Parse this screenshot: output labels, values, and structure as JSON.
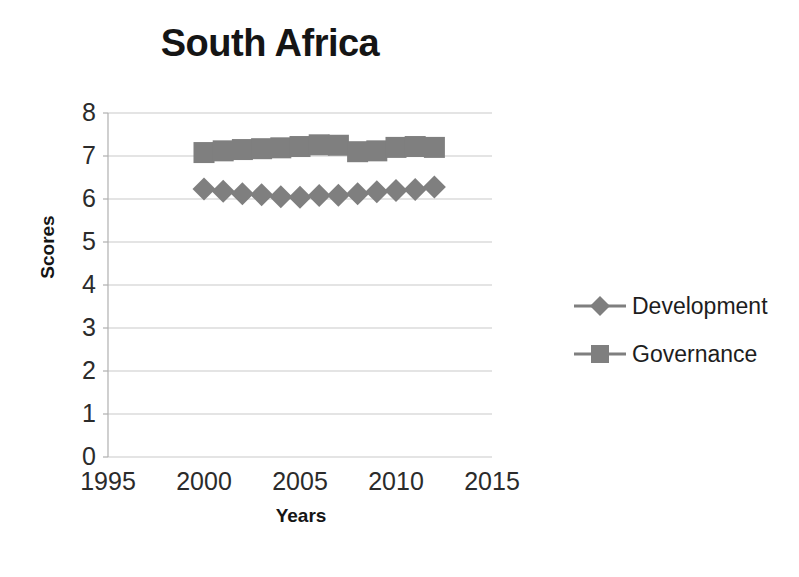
{
  "chart_data": {
    "type": "line",
    "title": "South Africa",
    "xlabel": "Years",
    "ylabel": "Scores",
    "xlim": [
      1995,
      2015
    ],
    "ylim": [
      0,
      8
    ],
    "grid": true,
    "legend_position": "right",
    "x_ticks": [
      "1995",
      "2000",
      "2005",
      "2010",
      "2015"
    ],
    "x_tick_values": [
      1995,
      2000,
      2005,
      2010,
      2015
    ],
    "y_ticks": [
      "0",
      "1",
      "2",
      "3",
      "4",
      "5",
      "6",
      "7",
      "8"
    ],
    "y_tick_values": [
      0,
      1,
      2,
      3,
      4,
      5,
      6,
      7,
      8
    ],
    "x": [
      2000,
      2001,
      2002,
      2003,
      2004,
      2005,
      2006,
      2007,
      2008,
      2009,
      2010,
      2011,
      2012
    ],
    "series": [
      {
        "name": "Development",
        "marker": "diamond",
        "color": "#7f7f7f",
        "values": [
          6.23,
          6.18,
          6.12,
          6.1,
          6.05,
          6.04,
          6.08,
          6.09,
          6.12,
          6.17,
          6.2,
          6.22,
          6.28
        ]
      },
      {
        "name": "Governance",
        "marker": "square",
        "color": "#7f7f7f",
        "values": [
          7.08,
          7.12,
          7.15,
          7.17,
          7.19,
          7.22,
          7.26,
          7.25,
          7.1,
          7.12,
          7.2,
          7.22,
          7.2
        ]
      }
    ]
  },
  "legend": {
    "items": [
      {
        "label": "Development",
        "marker": "diamond"
      },
      {
        "label": "Governance",
        "marker": "square"
      }
    ]
  },
  "colors": {
    "series": "#7f7f7f",
    "grid": "#c9c9c9",
    "axis": "#b0b0b0",
    "text": "#1d1d1d"
  }
}
